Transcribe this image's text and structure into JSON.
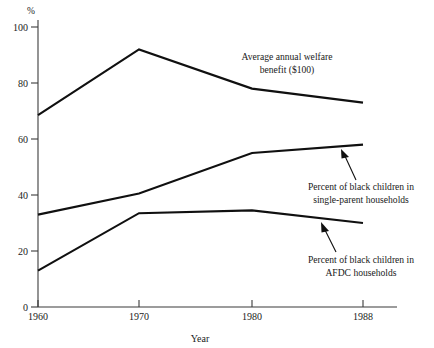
{
  "chart_data": {
    "type": "line",
    "title": "",
    "subtitle": "",
    "xlabel": "Year",
    "ylabel": "%",
    "x": [
      1960,
      1970,
      1980,
      1988
    ],
    "xtick_labels": [
      "1960",
      "1970",
      "1980",
      "1988"
    ],
    "ytick_labels": [
      "0",
      "20",
      "40",
      "60",
      "80",
      "100"
    ],
    "yticks": [
      0,
      20,
      40,
      60,
      80,
      100
    ],
    "ylim": [
      0,
      100
    ],
    "xlim": [
      1960,
      1988
    ],
    "grid": false,
    "legend_position": "inline-annotations",
    "series": [
      {
        "name": "Average annual welfare benefit ($100)",
        "values": [
          68.5,
          92.0,
          78.0,
          73.0
        ]
      },
      {
        "name": "Percent of black children in single-parent households",
        "values": [
          33.0,
          40.5,
          55.0,
          58.0
        ]
      },
      {
        "name": "Percent of black children in AFDC households",
        "values": [
          13.0,
          33.5,
          34.5,
          30.0
        ]
      }
    ],
    "annotations": [
      {
        "id": "welfare",
        "line1": "Average annual welfare",
        "line2": "benefit ($100)",
        "has_arrow": false
      },
      {
        "id": "single-parent",
        "line1": "Percent of black children in",
        "line2": "single-parent households",
        "has_arrow": true
      },
      {
        "id": "afdc",
        "line1": "Percent of black children in",
        "line2": "AFDC households",
        "has_arrow": true
      }
    ],
    "colors": {
      "line": "#101010",
      "axis": "#3b3b3b",
      "text": "#1a1a1a",
      "background": "#ffffff"
    }
  }
}
